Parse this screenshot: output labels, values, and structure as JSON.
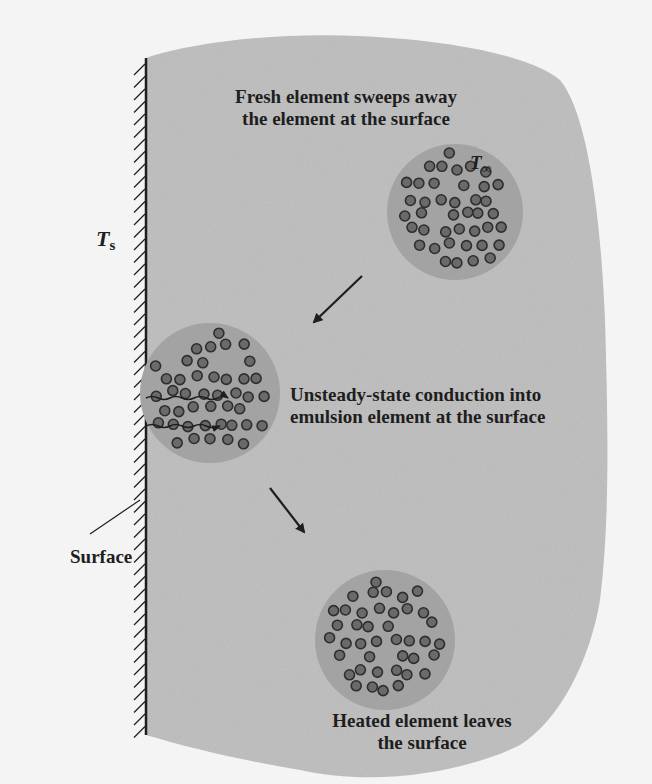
{
  "diagram": {
    "colors": {
      "page_background": "#f4f4f4",
      "emulsion_region": "#bdbdbd",
      "packet_fill": "#a3a3a3",
      "particle_fill": "#6a6a6a",
      "particle_stroke": "#2e2e2e",
      "wall_line": "#1e1e1e",
      "text": "#1e1e1e"
    },
    "labels": {
      "fresh_line1": "Fresh element sweeps away",
      "fresh_line2": "the element at the surface",
      "unsteady_line1": "Unsteady-state conduction into",
      "unsteady_line2": "emulsion element at the surface",
      "heated_line1": "Heated element leaves",
      "heated_line2": "the surface",
      "surface": "Surface",
      "wall_temperature_symbol": "T",
      "wall_temperature_subscript": "s",
      "bulk_temperature_symbol": "T",
      "bulk_temperature_subscript": "∞"
    },
    "elements": [
      {
        "name": "fresh-element",
        "cx": 455,
        "cy": 212,
        "r": 68
      },
      {
        "name": "element-at-surface",
        "cx": 210,
        "cy": 393,
        "r": 70
      },
      {
        "name": "heated-element",
        "cx": 385,
        "cy": 640,
        "r": 70
      }
    ],
    "arrows": [
      {
        "name": "arrow-fresh-to-surface",
        "from": [
          362,
          276
        ],
        "to": [
          312,
          324
        ]
      },
      {
        "name": "arrow-surface-to-heated",
        "from": [
          270,
          488
        ],
        "to": [
          306,
          534
        ]
      }
    ],
    "heat_flux_arrows": [
      {
        "name": "heat-flux-arrow-upper",
        "y": 398,
        "x_start": 146,
        "x_end": 228
      },
      {
        "name": "heat-flux-arrow-lower",
        "y": 425,
        "x_start": 146,
        "x_end": 220
      }
    ],
    "wall": {
      "x": 146,
      "y_top": 58,
      "y_bottom": 735
    }
  }
}
